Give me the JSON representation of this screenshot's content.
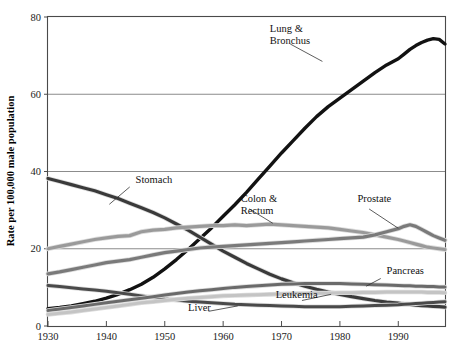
{
  "chart_data": {
    "type": "line",
    "title": "",
    "subtitle": "",
    "xlabel": "",
    "ylabel": "Rate per 100,000 male population",
    "xlim": [
      1930,
      1998
    ],
    "ylim": [
      0,
      80
    ],
    "xticks": [
      1930,
      1940,
      1950,
      1960,
      1970,
      1980,
      1990
    ],
    "yticks": [
      0,
      20,
      40,
      60,
      80
    ],
    "xtick_labels": [
      "1930",
      "1940",
      "1950",
      "1960",
      "1970",
      "1980",
      "1990"
    ],
    "ytick_labels": [
      "0",
      "20",
      "40",
      "60",
      "80"
    ],
    "grid": true,
    "grid_axis": "y",
    "legend": "inline-annotations",
    "x": [
      1930,
      1932,
      1934,
      1936,
      1938,
      1940,
      1942,
      1944,
      1946,
      1948,
      1950,
      1952,
      1954,
      1956,
      1958,
      1960,
      1962,
      1964,
      1966,
      1968,
      1970,
      1972,
      1974,
      1976,
      1978,
      1980,
      1982,
      1984,
      1986,
      1988,
      1990,
      1991,
      1992,
      1993,
      1994,
      1995,
      1996,
      1997,
      1998
    ],
    "series": [
      {
        "name": "Lung & Bronchus",
        "color": "#121212",
        "width": 3.4,
        "label_x": 1968,
        "label_y": 76,
        "values": [
          4.5,
          4.8,
          5.2,
          5.8,
          6.4,
          7.2,
          8.2,
          9.4,
          10.8,
          12.6,
          14.8,
          17.2,
          19.8,
          22.6,
          25.4,
          28.4,
          31.4,
          34.6,
          38.0,
          41.4,
          44.8,
          48.0,
          51.2,
          54.2,
          56.8,
          59.0,
          61.2,
          63.4,
          65.6,
          67.6,
          69.2,
          70.4,
          71.6,
          72.6,
          73.4,
          74.0,
          74.4,
          74.2,
          73.0
        ]
      },
      {
        "name": "Stomach",
        "color": "#3a3a3a",
        "width": 3.2,
        "label_x": 1945,
        "label_y": 37,
        "values": [
          38.2,
          37.4,
          36.6,
          35.8,
          35.0,
          34.0,
          33.0,
          31.8,
          30.6,
          29.4,
          28.0,
          26.4,
          24.8,
          23.0,
          21.2,
          19.4,
          17.8,
          16.2,
          14.8,
          13.4,
          12.2,
          11.2,
          10.3,
          9.5,
          8.8,
          8.2,
          7.6,
          7.1,
          6.6,
          6.2,
          5.9,
          5.7,
          5.6,
          5.4,
          5.3,
          5.2,
          5.1,
          5.0,
          4.9
        ]
      },
      {
        "name": "Colon & Rectum",
        "color": "#9a9a9a",
        "width": 3.2,
        "label_x": 1963,
        "label_y": 32,
        "values": [
          20.0,
          20.6,
          21.2,
          21.8,
          22.4,
          22.8,
          23.2,
          23.4,
          24.4,
          24.8,
          25.0,
          25.4,
          25.6,
          25.8,
          26.0,
          26.0,
          26.2,
          26.0,
          26.2,
          26.4,
          26.2,
          26.0,
          25.8,
          25.6,
          25.4,
          25.0,
          24.6,
          24.2,
          23.6,
          23.0,
          22.4,
          22.0,
          21.6,
          21.2,
          20.8,
          20.4,
          20.2,
          20.0,
          19.8
        ]
      },
      {
        "name": "Prostate",
        "color": "#7a7a7a",
        "width": 3.2,
        "label_x": 1983,
        "label_y": 32,
        "values": [
          13.5,
          14.0,
          14.6,
          15.2,
          15.8,
          16.4,
          16.8,
          17.2,
          17.8,
          18.4,
          19.0,
          19.4,
          19.8,
          20.2,
          20.4,
          20.6,
          20.8,
          21.0,
          21.2,
          21.4,
          21.6,
          21.8,
          22.0,
          22.2,
          22.4,
          22.6,
          22.8,
          23.0,
          23.6,
          24.4,
          25.2,
          25.8,
          26.2,
          25.8,
          25.0,
          24.2,
          23.4,
          22.8,
          22.2
        ]
      },
      {
        "name": "Liver",
        "color": "#4a4a4a",
        "width": 3.0,
        "label_x": 1954,
        "label_y": 4.0,
        "values": [
          10.5,
          10.2,
          9.9,
          9.6,
          9.3,
          9.0,
          8.6,
          8.2,
          7.8,
          7.4,
          7.0,
          6.7,
          6.4,
          6.2,
          6.0,
          5.8,
          5.6,
          5.5,
          5.4,
          5.3,
          5.2,
          5.1,
          5.0,
          5.0,
          5.0,
          5.0,
          5.1,
          5.2,
          5.3,
          5.4,
          5.5,
          5.6,
          5.7,
          5.8,
          5.9,
          6.0,
          6.1,
          6.2,
          6.3
        ]
      },
      {
        "name": "Pancreas",
        "color": "#6a6a6a",
        "width": 3.0,
        "label_x": 1988,
        "label_y": 13.5,
        "values": [
          4.0,
          4.4,
          4.8,
          5.2,
          5.6,
          6.0,
          6.4,
          6.8,
          7.2,
          7.6,
          8.0,
          8.4,
          8.8,
          9.1,
          9.4,
          9.7,
          10.0,
          10.2,
          10.4,
          10.6,
          10.8,
          10.9,
          11.0,
          11.0,
          11.0,
          11.0,
          10.9,
          10.8,
          10.7,
          10.6,
          10.5,
          10.4,
          10.4,
          10.3,
          10.3,
          10.2,
          10.2,
          10.1,
          10.1
        ]
      },
      {
        "name": "Leukemia",
        "color": "#c4c4c4",
        "width": 3.0,
        "label_x": 1969,
        "label_y": 7.2,
        "values": [
          3.0,
          3.3,
          3.6,
          4.0,
          4.4,
          4.8,
          5.2,
          5.6,
          6.0,
          6.3,
          6.6,
          6.9,
          7.2,
          7.4,
          7.6,
          7.8,
          7.9,
          8.0,
          8.1,
          8.2,
          8.3,
          8.4,
          8.4,
          8.5,
          8.5,
          8.6,
          8.6,
          8.7,
          8.7,
          8.8,
          8.8,
          8.8,
          8.8,
          8.8,
          8.8,
          8.7,
          8.7,
          8.7,
          8.6
        ]
      }
    ],
    "annotations": [
      {
        "text": "Lung & Bronchus",
        "line1": "Lung &",
        "line2": "Bronchus"
      },
      {
        "text": "Stomach",
        "line1": "Stomach",
        "line2": ""
      },
      {
        "text": "Colon & Rectum",
        "line1": "Colon &",
        "line2": "Rectum"
      },
      {
        "text": "Prostate",
        "line1": "Prostate",
        "line2": ""
      },
      {
        "text": "Pancreas",
        "line1": "Pancreas",
        "line2": ""
      },
      {
        "text": "Leukemia",
        "line1": "Leukemia",
        "line2": ""
      },
      {
        "text": "Liver",
        "line1": "Liver",
        "line2": ""
      }
    ]
  }
}
